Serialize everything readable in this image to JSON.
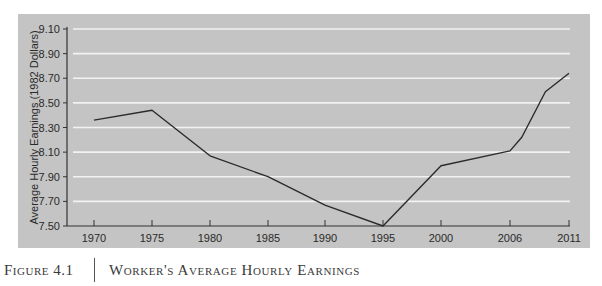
{
  "caption": {
    "figure_label": "Figure 4.1",
    "title": "Worker's Average Hourly Earnings"
  },
  "colors": {
    "panel_bg": "#c4c4c4",
    "gridline": "#f2f2f2",
    "line": "#2b2b2b",
    "axis": "#333333"
  },
  "chart_data": {
    "type": "line",
    "title": "Worker's Average Hourly Earnings",
    "xlabel": "",
    "ylabel": "Average Hourly Earnings (1982 Dollars)",
    "x_tick_labels": [
      "1970",
      "1975",
      "1980",
      "1985",
      "1990",
      "1995",
      "2000",
      "2006",
      "2011"
    ],
    "y_tick_labels": [
      "7.50",
      "7.70",
      "7.90",
      "8.10",
      "8.30",
      "8.50",
      "8.70",
      "8.90",
      "9.10"
    ],
    "ylim": [
      7.5,
      9.1
    ],
    "grid": true,
    "legend": null,
    "series": [
      {
        "name": "Average Hourly Earnings",
        "x": [
          1970,
          1975,
          1980,
          1985,
          1990,
          1995,
          2000,
          2006,
          2007,
          2009,
          2011
        ],
        "values": [
          8.36,
          8.44,
          8.07,
          7.9,
          7.67,
          7.5,
          7.99,
          8.11,
          8.22,
          8.59,
          8.74
        ]
      }
    ]
  }
}
